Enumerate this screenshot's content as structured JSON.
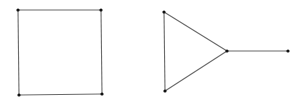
{
  "diagram": {
    "colors": {
      "edge": "#6a6a6a",
      "vertex": "#111111",
      "background": "#ffffff"
    },
    "graphs": [
      {
        "name": "square-graph",
        "vertices": [
          [
            18,
            10
          ],
          [
            101,
            10
          ],
          [
            102,
            94
          ],
          [
            19,
            95
          ]
        ],
        "edges": [
          [
            0,
            1
          ],
          [
            1,
            2
          ],
          [
            2,
            3
          ],
          [
            3,
            0
          ]
        ]
      },
      {
        "name": "triangle-with-tail-graph",
        "vertices": [
          [
            164,
            12
          ],
          [
            165,
            91
          ],
          [
            227,
            51
          ],
          [
            288,
            51
          ]
        ],
        "edges": [
          [
            0,
            1
          ],
          [
            1,
            2
          ],
          [
            2,
            0
          ],
          [
            2,
            3
          ]
        ]
      }
    ]
  }
}
